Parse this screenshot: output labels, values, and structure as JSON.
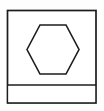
{
  "canvas": {
    "width": 104,
    "height": 111,
    "background_color": "#fefefe"
  },
  "figure": {
    "name": "hexagon-in-framed-box",
    "stroke_color": "#1c1c1c",
    "fill_color": "#ffffff",
    "stroke_width": 1.6
  },
  "outer_frame": {
    "label": "outer-rectangle",
    "x": 7.5,
    "y": 10.5,
    "width": 88.5,
    "height": 92.5,
    "fill": "#ffffff",
    "stroke": "#1c1c1c",
    "stroke_width": 1.7
  },
  "divider": {
    "label": "horizontal-divider-line",
    "x1": 7.5,
    "y1": 85,
    "x2": 96,
    "y2": 85,
    "stroke": "#1c1c1c",
    "stroke_width": 1.7
  },
  "hexagon": {
    "label": "hexagon-outline",
    "orientation": "pointy-sides",
    "center_x": 53,
    "center_y": 49.5,
    "points": "27,49.5 40,25 66,25 79,49.5 66,74 40,74",
    "vertices": [
      {
        "name": "left",
        "x": 27,
        "y": 49.5
      },
      {
        "name": "top-left",
        "x": 40,
        "y": 25
      },
      {
        "name": "top-right",
        "x": 66,
        "y": 25
      },
      {
        "name": "right",
        "x": 79,
        "y": 49.5
      },
      {
        "name": "bottom-right",
        "x": 66,
        "y": 74
      },
      {
        "name": "bottom-left",
        "x": 40,
        "y": 74
      }
    ],
    "fill": "#ffffff",
    "stroke": "#1c1c1c",
    "stroke_width": 1.6
  },
  "bottom_strip": {
    "label": "bottom-empty-strip",
    "x": 7.5,
    "y": 85,
    "width": 88.5,
    "height": 18,
    "fill": "#ffffff",
    "content": ""
  }
}
